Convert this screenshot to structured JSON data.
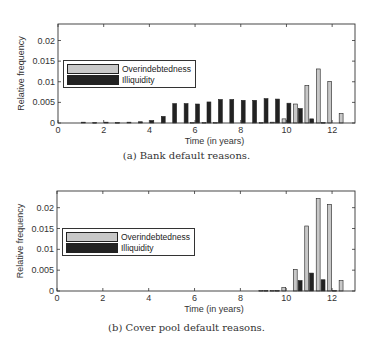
{
  "chart_data": [
    {
      "type": "bar",
      "title": "",
      "caption": "(a) Bank default reasons.",
      "xlabel": "Time (in years)",
      "ylabel": "Relative frequency",
      "xlim": [
        0,
        13
      ],
      "ylim": [
        0,
        0.024
      ],
      "xticks": [
        "0",
        "2",
        "4",
        "6",
        "8",
        "10",
        "12"
      ],
      "yticks": [
        "0",
        "0.005",
        "0.01",
        "0.015",
        "0.02"
      ],
      "legend_position": "upper left",
      "x": [
        1,
        1.5,
        2,
        2.5,
        3,
        3.5,
        4,
        4.5,
        5,
        5.5,
        6,
        6.5,
        7,
        7.5,
        8,
        8.5,
        9,
        9.5,
        10,
        10.5,
        11,
        11.5,
        12,
        12.5
      ],
      "series": [
        {
          "name": "Overindebtedness",
          "color": "#c8c8c8",
          "values": [
            0,
            0,
            0,
            0,
            0,
            0,
            0,
            0,
            0,
            0,
            0.0001,
            0.0001,
            0.0001,
            0,
            0,
            0,
            0.0001,
            0.0002,
            0.001,
            0.0046,
            0.0091,
            0.0131,
            0.0101,
            0.0023
          ]
        },
        {
          "name": "Illiquidity",
          "color": "#222222",
          "values": [
            0.0002,
            0.0001,
            0.0002,
            0.0001,
            0.0002,
            0.0003,
            0.0006,
            0.0016,
            0.0047,
            0.0047,
            0.0046,
            0.0051,
            0.0057,
            0.0057,
            0.0055,
            0.0055,
            0.0059,
            0.0058,
            0.0048,
            0.0035,
            0.001,
            0.0001,
            0,
            0
          ]
        }
      ]
    },
    {
      "type": "bar",
      "title": "",
      "caption": "(b) Cover pool default reasons.",
      "xlabel": "Time (in years)",
      "ylabel": "Relative frequency",
      "xlim": [
        0,
        13
      ],
      "ylim": [
        0,
        0.024
      ],
      "xticks": [
        "0",
        "2",
        "4",
        "6",
        "8",
        "10",
        "12"
      ],
      "yticks": [
        "0",
        "0.005",
        "0.01",
        "0.015",
        "0.02"
      ],
      "legend_position": "upper left",
      "x": [
        9,
        9.5,
        10,
        10.5,
        11,
        11.5,
        12,
        12.5
      ],
      "series": [
        {
          "name": "Overindebtedness",
          "color": "#c8c8c8",
          "values": [
            0.0001,
            0.0001,
            0.0008,
            0.0052,
            0.0156,
            0.0222,
            0.0208,
            0.0025
          ]
        },
        {
          "name": "Illiquidity",
          "color": "#222222",
          "values": [
            0.0001,
            0.0001,
            0,
            0.0025,
            0.0043,
            0.0027,
            0.0001,
            0
          ]
        }
      ]
    }
  ]
}
